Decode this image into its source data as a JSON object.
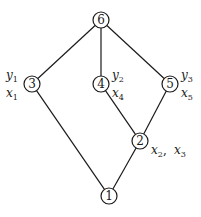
{
  "diagram": {
    "type": "hasse-diagram",
    "colors": {
      "stroke": "#1a1a1a",
      "background": "#ffffff"
    },
    "nodes": [
      {
        "id": "6",
        "label": "6",
        "x": 101,
        "y": 20
      },
      {
        "id": "3",
        "label": "3",
        "x": 32,
        "y": 84
      },
      {
        "id": "4",
        "label": "4",
        "x": 101,
        "y": 84
      },
      {
        "id": "5",
        "label": "5",
        "x": 170,
        "y": 84
      },
      {
        "id": "2",
        "label": "2",
        "x": 140,
        "y": 141
      },
      {
        "id": "1",
        "label": "1",
        "x": 109,
        "y": 196
      }
    ],
    "edges": [
      {
        "from": "6",
        "to": "3"
      },
      {
        "from": "6",
        "to": "4"
      },
      {
        "from": "6",
        "to": "5"
      },
      {
        "from": "3",
        "to": "1"
      },
      {
        "from": "4",
        "to": "2"
      },
      {
        "from": "5",
        "to": "2"
      },
      {
        "from": "2",
        "to": "1"
      }
    ],
    "annotations": [
      {
        "node": "3",
        "base": "y",
        "sub": "1",
        "x": 6,
        "y": 79
      },
      {
        "node": "3",
        "base": "x",
        "sub": "1",
        "x": 6,
        "y": 97
      },
      {
        "node": "4",
        "base": "y",
        "sub": "2",
        "x": 112,
        "y": 79
      },
      {
        "node": "4",
        "base": "x",
        "sub": "4",
        "x": 112,
        "y": 97
      },
      {
        "node": "5",
        "base": "y",
        "sub": "3",
        "x": 181,
        "y": 79
      },
      {
        "node": "5",
        "base": "x",
        "sub": "5",
        "x": 181,
        "y": 97
      },
      {
        "node": "2",
        "base": "x",
        "sub": "2",
        "x": 151,
        "y": 154,
        "suffix": ", "
      },
      {
        "node": "2",
        "base": "x",
        "sub": "3",
        "x": 174,
        "y": 154
      }
    ]
  }
}
